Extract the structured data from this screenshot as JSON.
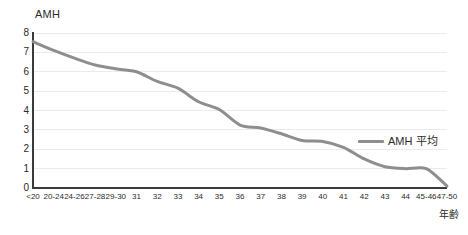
{
  "chart_data": {
    "type": "line",
    "title": "",
    "ylabel": "AMH",
    "xlabel": "年齢",
    "ylim": [
      0,
      8
    ],
    "yticks": [
      8,
      7,
      6,
      5,
      4,
      3,
      2,
      1,
      0
    ],
    "grid": true,
    "legend_position": "inside-right",
    "categories": [
      "<20",
      "20-24",
      "24-26",
      "27-28",
      "29-30",
      "31",
      "32",
      "33",
      "34",
      "35",
      "36",
      "37",
      "38",
      "39",
      "40",
      "41",
      "42",
      "43",
      "44",
      "45-46",
      "47-50"
    ],
    "series": [
      {
        "name": "AMH 平均",
        "color": "#8e8e8e",
        "values": [
          7.55,
          7.1,
          6.7,
          6.35,
          6.15,
          6.0,
          5.5,
          5.15,
          4.45,
          4.05,
          3.25,
          3.1,
          2.8,
          2.45,
          2.4,
          2.1,
          1.5,
          1.1,
          1.0,
          1.0,
          0.1
        ]
      }
    ]
  },
  "legend": {
    "entries": [
      {
        "label": "AMH 平均"
      }
    ]
  },
  "axes": {
    "y_title": "AMH",
    "x_title": "年齢"
  },
  "colors": {
    "line": "#8e8e8e",
    "grid": "#ebebeb",
    "axis": "#3a3a3a",
    "text": "#2b2b2b",
    "background": "#ffffff"
  }
}
